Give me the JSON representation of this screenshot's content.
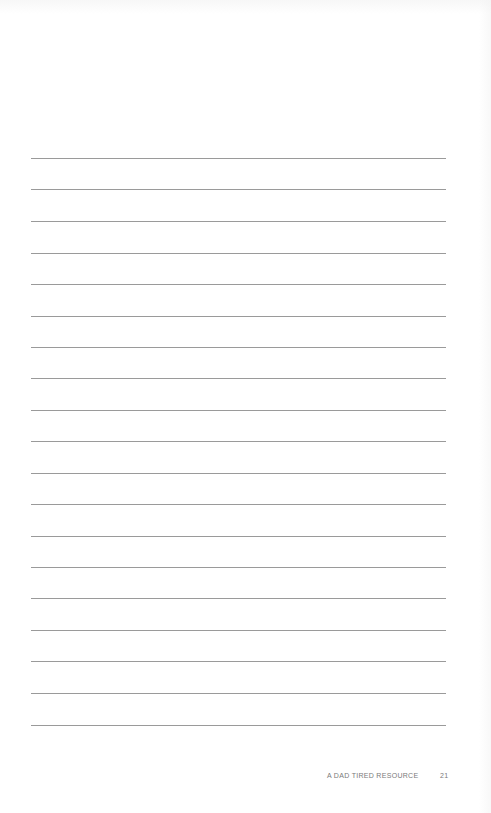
{
  "page": {
    "type": "lined-notes-page",
    "line_count": 19,
    "line_color": "#9a9a9a",
    "line_positions_y": [
      158,
      189,
      221,
      253,
      284,
      316,
      347,
      378,
      410,
      441,
      473,
      504,
      536,
      567,
      598,
      630,
      661,
      693,
      725
    ]
  },
  "footer": {
    "label": "A DAD TIRED RESOURCE",
    "page_number": "21"
  }
}
